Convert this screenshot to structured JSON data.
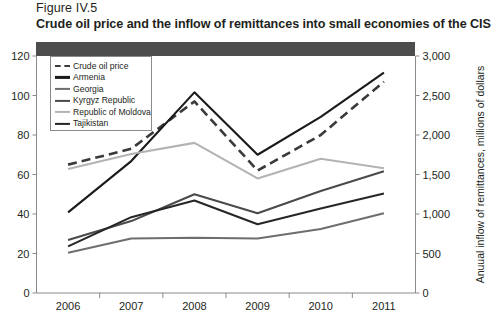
{
  "figure": {
    "number": "Figure IV.5",
    "title": "Crude oil price and the inflow of remittances into small economies of the CIS"
  },
  "chart_data": {
    "type": "line",
    "title": "Crude oil price and the inflow of remittances into small economies of the CIS",
    "xlabel": "",
    "ylabel": "",
    "y2label": "Anuual inflow of remittances, millions of dollars",
    "categories": [
      "2006",
      "2007",
      "2008",
      "2009",
      "2010",
      "2011"
    ],
    "x": [
      2006,
      2007,
      2008,
      2009,
      2010,
      2011
    ],
    "ylim": [
      0,
      120
    ],
    "y2lim": [
      0,
      3000
    ],
    "yticks": [
      "0",
      "20",
      "40",
      "60",
      "80",
      "100",
      "120"
    ],
    "y2ticks": [
      "0",
      "500",
      "1,000",
      "1,500",
      "2,000",
      "2,500",
      "3,000"
    ],
    "grid": false,
    "legend_position": "top-left",
    "series": [
      {
        "name": "Crude oil price",
        "axis": "left",
        "style": "dashed",
        "color": "#3a3a3a",
        "values": [
          65,
          73,
          97,
          62,
          80,
          107
        ]
      },
      {
        "name": "Armenia",
        "axis": "right",
        "style": "solid",
        "color": "#1a1a1a",
        "values": [
          1020,
          1670,
          2540,
          1750,
          2230,
          2790
        ]
      },
      {
        "name": "Georgia",
        "axis": "right",
        "style": "solid",
        "color": "#6e6e6e",
        "values": [
          510,
          690,
          700,
          690,
          810,
          1010
        ]
      },
      {
        "name": "Kyrgyz Republic",
        "axis": "right",
        "style": "solid",
        "color": "#4a4a4a",
        "values": [
          670,
          910,
          1250,
          1010,
          1290,
          1540
        ]
      },
      {
        "name": "Republic of Moldova",
        "axis": "right",
        "style": "solid",
        "color": "#b3b3b3",
        "values": [
          1570,
          1760,
          1900,
          1450,
          1700,
          1580
        ]
      },
      {
        "name": "Tajikistan",
        "axis": "right",
        "style": "solid",
        "color": "#262626",
        "values": [
          590,
          960,
          1170,
          870,
          1070,
          1260
        ]
      }
    ]
  },
  "legend": {
    "items": [
      {
        "label": "Crude oil price"
      },
      {
        "label": "Armenia"
      },
      {
        "label": "Georgia"
      },
      {
        "label": "Kyrgyz Republic"
      },
      {
        "label": "Republic of Moldova"
      },
      {
        "label": "Tajikistan"
      }
    ]
  }
}
